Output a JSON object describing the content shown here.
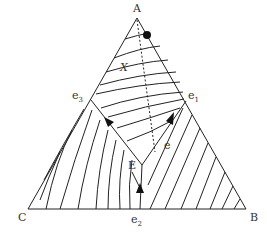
{
  "diagram": {
    "type": "ternary-phase-diagram",
    "vertices": {
      "top": "A",
      "left": "C",
      "right": "B"
    },
    "eutectics": {
      "e1": "e",
      "e2": "e",
      "e3": "e"
    },
    "eutectic_subscripts": {
      "e1": "1",
      "e2": "2",
      "e3": "3"
    },
    "ternary_point": "E",
    "composition_point": "X",
    "boundary_label": "e",
    "colors": {
      "line": "#222222",
      "background": "#ffffff"
    }
  }
}
